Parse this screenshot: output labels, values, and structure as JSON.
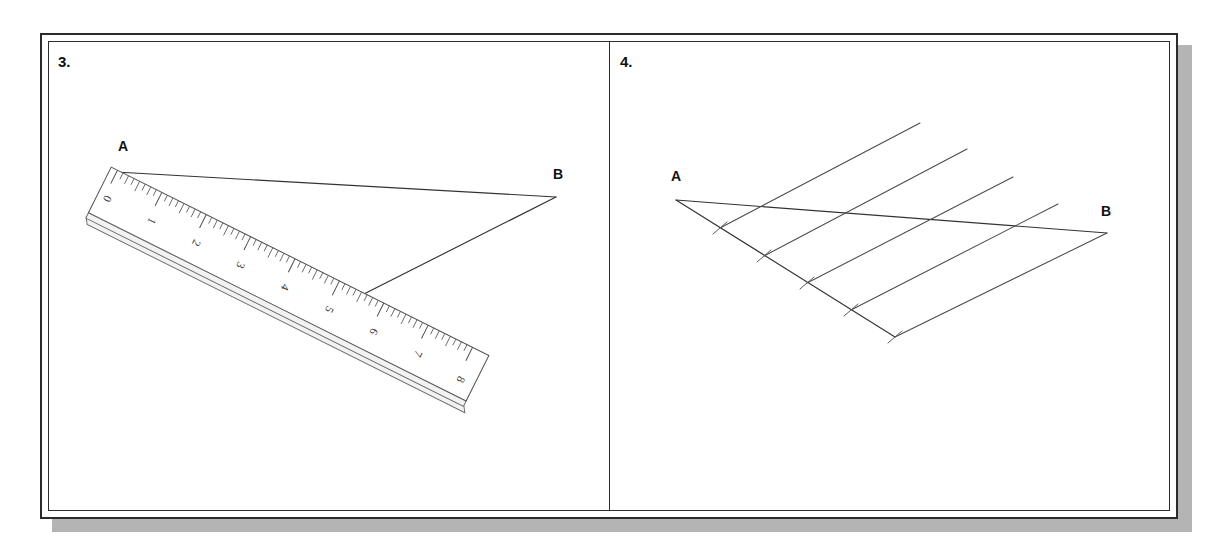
{
  "page": {
    "background": "#ffffff",
    "frame_border_color": "#2b2b2b",
    "shadow_color": "#b4b4b4"
  },
  "panels": [
    {
      "number": "3.",
      "name": "measuring-with-ruler",
      "points": [
        {
          "label": "A",
          "x": 116,
          "y": 172
        },
        {
          "label": "B",
          "x": 556,
          "y": 197
        }
      ],
      "ruler": {
        "name": "ruler",
        "units": [
          "0",
          "1",
          "2",
          "3",
          "4",
          "5",
          "6",
          "7",
          "8"
        ],
        "minor_divisions_per_unit": 8,
        "zero_at_point": "A",
        "marked_reading": "5"
      },
      "lines": [
        {
          "name": "segment-a-b",
          "from": "A",
          "to": "B"
        },
        {
          "name": "segment-b-to-five-mark",
          "from": "B",
          "to": "5"
        }
      ]
    },
    {
      "number": "4.",
      "name": "dividing-segment-parallel-lines",
      "points": [
        {
          "label": "A",
          "x": 676,
          "y": 200
        },
        {
          "label": "B",
          "x": 1107,
          "y": 215
        }
      ],
      "construction": {
        "ray_tick_count": 5,
        "parallel_line_count": 4,
        "description_ticks": [
          "1",
          "2",
          "3",
          "4",
          "5"
        ]
      },
      "lines": [
        {
          "name": "segment-a-b",
          "from": "A",
          "to": "B"
        },
        {
          "name": "construction-ray",
          "from": "A",
          "to": "tick-5"
        },
        {
          "name": "parallel-1",
          "from": "tick-5",
          "to": "B"
        },
        {
          "name": "parallel-2",
          "from": "tick-4",
          "to": "ab-point-4"
        },
        {
          "name": "parallel-3",
          "from": "tick-3",
          "to": "ab-point-3"
        },
        {
          "name": "parallel-4",
          "from": "tick-2",
          "to": "ab-point-2"
        },
        {
          "name": "parallel-5",
          "from": "tick-1",
          "to": "ab-point-1"
        }
      ]
    }
  ]
}
